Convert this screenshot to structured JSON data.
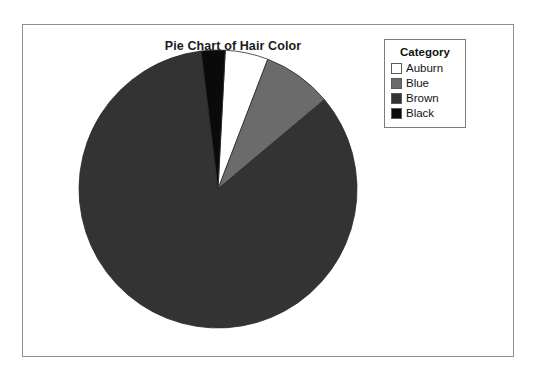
{
  "figure": {
    "title": "Pie Chart of Hair Color",
    "background_color": "#ffffff",
    "frame_color": "#8d8d8d"
  },
  "legend": {
    "title": "Category",
    "position": "top-right",
    "border_color": "#7d7d7d",
    "entries": [
      {
        "label": "Auburn",
        "color": "#ffffff"
      },
      {
        "label": "Blue",
        "color": "#6b6b6b"
      },
      {
        "label": "Brown",
        "color": "#333333"
      },
      {
        "label": "Black",
        "color": "#0a0a0a"
      }
    ]
  },
  "chart_data": {
    "type": "pie",
    "title": "Pie Chart of Hair Color",
    "xlabel": "",
    "ylabel": "",
    "legend_title": "Category",
    "legend_position": "top-right",
    "grid": false,
    "start_angle_deg": 0,
    "direction": "clockwise",
    "categories": [
      "Auburn",
      "Blue",
      "Brown",
      "Black"
    ],
    "values": [
      5,
      8,
      84,
      3
    ],
    "units": "percent",
    "slices": [
      {
        "label": "Auburn",
        "value": 5,
        "color": "#ffffff",
        "start_deg": 3,
        "end_deg": 21
      },
      {
        "label": "Blue",
        "value": 8,
        "color": "#6b6b6b",
        "start_deg": 21,
        "end_deg": 50
      },
      {
        "label": "Brown",
        "value": 84,
        "color": "#333333",
        "start_deg": 50,
        "end_deg": 353
      },
      {
        "label": "Black",
        "value": 3,
        "color": "#0a0a0a",
        "start_deg": 353,
        "end_deg": 363
      }
    ]
  }
}
